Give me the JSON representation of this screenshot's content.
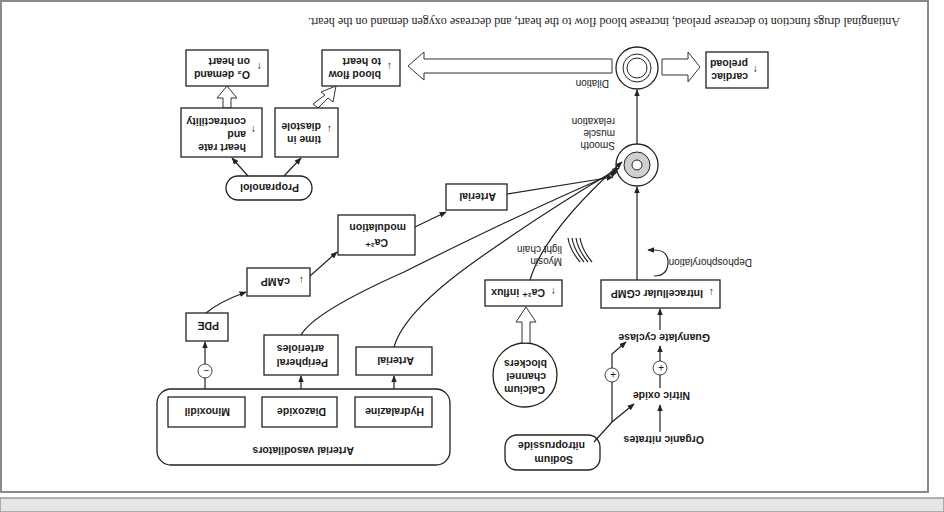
{
  "caption": "Antianginal drugs function to decrease preload, increase blood flow to the heart, and decrease oxygen demand on the heart.",
  "orientation": "rotated 180 degrees",
  "colors": {
    "frame": "#8a8a8a",
    "bottom_bar": "#e4e6e8",
    "ink": "#222222",
    "vessel_fill": "#cfcfcf"
  },
  "nodes": {
    "o2_demand": {
      "arrow": "↑",
      "line1": "O₂ demand",
      "line2": "on heart"
    },
    "heart_rate": {
      "line1": "heart rate",
      "line2": "and",
      "line3": "contractility",
      "arrow": "↑"
    },
    "time_diastole": {
      "line1": "time in",
      "line2": "diastole",
      "arrow": "↓"
    },
    "blood_flow": {
      "line1": "blood flow",
      "line2": "to heart",
      "arrow": "↓"
    },
    "propranolol": "Propranolol",
    "dilation": "Dilation",
    "cardiac_preload": {
      "line1": "cardiac",
      "line2": "preload",
      "arrow": "↑"
    },
    "smooth_muscle": {
      "line1": "Smooth",
      "line2": "muscle",
      "line3": "relaxation"
    },
    "arterial_upper": "Arterial",
    "ca_modulation": {
      "line1": "Ca²⁺",
      "line2": "modulation"
    },
    "camp": {
      "arrow": "↓",
      "label": "cAMP"
    },
    "pde": "PDE",
    "ca_influx": {
      "arrow": "↑",
      "label": "Ca²⁺ influx"
    },
    "intracellular_cgmp": {
      "arrow": "↓",
      "label": "Intracellular cGMP"
    },
    "dephosphorylation": "Dephosphorylation",
    "myosin": {
      "line1": "Myosin",
      "line2": "light chain"
    },
    "peripheral_arterioles": {
      "line1": "Peripheral",
      "line2": "arterioles"
    },
    "arterial_lower": "Arterial",
    "ccb": {
      "line1": "Calcium",
      "line2": "channel",
      "line3": "blockers"
    },
    "arterial_vasodilators": {
      "title": "Arterial vasodilators",
      "members": [
        "Hydralazine",
        "Diazoxide",
        "Minoxidil"
      ]
    },
    "minus_sign": "−",
    "plus_sign": "+",
    "guanylate_cyclase": "Guanylate cyclase",
    "nitric_oxide": "Nitric oxide",
    "organic_nitrates": "Organic nitrates",
    "sodium_nitroprusside": {
      "line1": "Sodium",
      "line2": "nitroprusside"
    }
  }
}
